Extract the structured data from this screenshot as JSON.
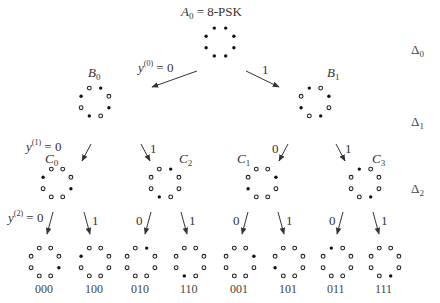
{
  "title": {
    "symbol": "A",
    "sub": "0",
    "eq": "= 8-PSK"
  },
  "levels": [
    {
      "name": "Δ",
      "sub": "0"
    },
    {
      "name": "Δ",
      "sub": "1"
    },
    {
      "name": "Δ",
      "sub": "2"
    }
  ],
  "nodes": [
    {
      "id": "A0",
      "cx": 220,
      "cy": 42,
      "filled": [
        0,
        1,
        2,
        3,
        4,
        5,
        6,
        7
      ]
    },
    {
      "id": "B0",
      "cx": 95,
      "cy": 102,
      "label": "B",
      "sub": "0",
      "filled": [
        0,
        2,
        4,
        6
      ]
    },
    {
      "id": "B1",
      "cx": 315,
      "cy": 102,
      "label": "B",
      "sub": "1",
      "filled": [
        1,
        3,
        5,
        7
      ]
    },
    {
      "id": "C0",
      "cx": 57,
      "cy": 183,
      "label": "C",
      "sub": "0",
      "filled": [
        2,
        6
      ]
    },
    {
      "id": "C2",
      "cx": 165,
      "cy": 183,
      "label": "C",
      "sub": "2",
      "filled": [
        0,
        4
      ]
    },
    {
      "id": "C1",
      "cx": 262,
      "cy": 183,
      "label": "C",
      "sub": "1",
      "filled": [
        3,
        7
      ]
    },
    {
      "id": "C3",
      "cx": 365,
      "cy": 183,
      "label": "C",
      "sub": "3",
      "filled": [
        1,
        5
      ]
    },
    {
      "id": "L000",
      "cx": 45,
      "cy": 262,
      "bits": "000",
      "filled": [
        6
      ]
    },
    {
      "id": "L100",
      "cx": 95,
      "cy": 262,
      "bits": "100",
      "filled": [
        2
      ]
    },
    {
      "id": "L010",
      "cx": 141,
      "cy": 262,
      "bits": "010",
      "filled": [
        0
      ]
    },
    {
      "id": "L110",
      "cx": 190,
      "cy": 262,
      "bits": "110",
      "filled": [
        4
      ]
    },
    {
      "id": "L001",
      "cx": 240,
      "cy": 262,
      "bits": "001",
      "filled": [
        7
      ]
    },
    {
      "id": "L101",
      "cx": 289,
      "cy": 262,
      "bits": "101",
      "filled": [
        3
      ]
    },
    {
      "id": "L011",
      "cx": 337,
      "cy": 262,
      "bits": "011",
      "filled": [
        1
      ]
    },
    {
      "id": "L111",
      "cx": 385,
      "cy": 262,
      "bits": "111",
      "filled": [
        5
      ]
    }
  ],
  "branches": [
    {
      "x1": 197,
      "y1": 71,
      "x2": 152,
      "y2": 87,
      "label": "y(0) = 0",
      "level": 0,
      "bit": "0"
    },
    {
      "x1": 246,
      "y1": 71,
      "x2": 279,
      "y2": 87,
      "label": "1",
      "level": 0,
      "bit": "1"
    },
    {
      "x1": 91,
      "y1": 144,
      "x2": 82,
      "y2": 161,
      "label": "y(1) = 0",
      "level": 1,
      "bit": "0"
    },
    {
      "x1": 141,
      "y1": 144,
      "x2": 150,
      "y2": 161,
      "label": "1",
      "level": 1,
      "bit": "1"
    },
    {
      "x1": 288,
      "y1": 144,
      "x2": 279,
      "y2": 161,
      "label": "0",
      "level": 1,
      "bit": "0"
    },
    {
      "x1": 336,
      "y1": 144,
      "x2": 345,
      "y2": 161,
      "label": "1",
      "level": 1,
      "bit": "1"
    },
    {
      "x1": 53,
      "y1": 212,
      "x2": 47,
      "y2": 234,
      "label": "y(2) = 0",
      "level": 2,
      "bit": "0"
    },
    {
      "x1": 84,
      "y1": 212,
      "x2": 90,
      "y2": 234,
      "label": "1",
      "level": 2,
      "bit": "1"
    },
    {
      "x1": 151,
      "y1": 212,
      "x2": 145,
      "y2": 234,
      "label": "0",
      "level": 2,
      "bit": "0"
    },
    {
      "x1": 181,
      "y1": 212,
      "x2": 187,
      "y2": 234,
      "label": "1",
      "level": 2,
      "bit": "1"
    },
    {
      "x1": 248,
      "y1": 212,
      "x2": 242,
      "y2": 234,
      "label": "0",
      "level": 2,
      "bit": "0"
    },
    {
      "x1": 278,
      "y1": 212,
      "x2": 284,
      "y2": 234,
      "label": "1",
      "level": 2,
      "bit": "1"
    },
    {
      "x1": 343,
      "y1": 212,
      "x2": 337,
      "y2": 234,
      "label": "0",
      "level": 2,
      "bit": "0"
    },
    {
      "x1": 373,
      "y1": 212,
      "x2": 379,
      "y2": 234,
      "label": "1",
      "level": 2,
      "bit": "1"
    }
  ],
  "text": {
    "y0_eq": "= 0",
    "y1_eq": "= 0",
    "y2_eq": "= 0",
    "y": "y",
    "sup0": "(0)",
    "sup1": "(1)",
    "sup2": "(2)",
    "one": "1",
    "zero": "0"
  }
}
